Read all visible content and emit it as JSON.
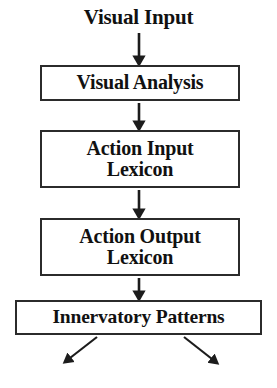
{
  "diagram": {
    "title": "Visual Input",
    "background_color": "#ffffff",
    "stroke_color": "#2b2b2b",
    "text_color": "#111111",
    "type": "flowchart",
    "orientation": "top-to-bottom",
    "nodes": [
      {
        "id": "visual-input",
        "label": "Visual Input",
        "boxed": false,
        "x": 72,
        "y": 6,
        "width": 133,
        "height": 26
      },
      {
        "id": "visual-analysis",
        "label": "Visual Analysis",
        "boxed": true,
        "x": 40,
        "y": 65,
        "width": 200,
        "height": 36
      },
      {
        "id": "action-input-lexicon",
        "label": "Action Input\nLexicon",
        "boxed": true,
        "x": 40,
        "y": 130,
        "width": 200,
        "height": 58
      },
      {
        "id": "action-output-lexicon",
        "label": "Action Output\nLexicon",
        "boxed": true,
        "x": 40,
        "y": 218,
        "width": 200,
        "height": 58
      },
      {
        "id": "innervatory-patterns",
        "label": "Innervatory Patterns",
        "boxed": true,
        "x": 15,
        "y": 300,
        "width": 247,
        "height": 35
      }
    ],
    "edges": [
      {
        "id": "edge-input-to-analysis",
        "from": "visual-input",
        "to": "visual-analysis",
        "direction": "down",
        "x1": 139,
        "y1": 33,
        "x2": 139,
        "y2": 63
      },
      {
        "id": "edge-analysis-to-action-input",
        "from": "visual-analysis",
        "to": "action-input-lexicon",
        "direction": "down",
        "x1": 139,
        "y1": 102,
        "x2": 139,
        "y2": 128
      },
      {
        "id": "edge-action-input-to-action-output",
        "from": "action-input-lexicon",
        "to": "action-output-lexicon",
        "direction": "down",
        "x1": 139,
        "y1": 189,
        "x2": 139,
        "y2": 216
      },
      {
        "id": "edge-action-output-to-innervatory",
        "from": "action-output-lexicon",
        "to": "innervatory-patterns",
        "direction": "down",
        "x1": 139,
        "y1": 277,
        "x2": 139,
        "y2": 298
      },
      {
        "id": "edge-innervatory-out-left",
        "from": "innervatory-patterns",
        "to": null,
        "direction": "down-left",
        "x1": 96,
        "y1": 337,
        "x2": 63,
        "y2": 364
      },
      {
        "id": "edge-innervatory-out-right",
        "from": "innervatory-patterns",
        "to": null,
        "direction": "down-right",
        "x1": 185,
        "y1": 337,
        "x2": 219,
        "y2": 366
      }
    ]
  }
}
